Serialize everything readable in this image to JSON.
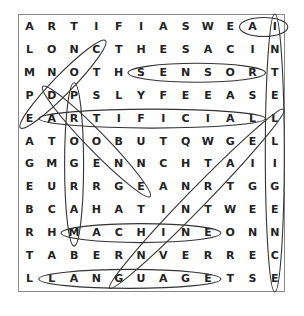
{
  "puzzle": {
    "grid": [
      [
        "A",
        "R",
        "T",
        "I",
        "F",
        "I",
        "A",
        "S",
        "W",
        "E",
        "A",
        "I"
      ],
      [
        "L",
        "O",
        "N",
        "C",
        "T",
        "H",
        "E",
        "S",
        "A",
        "C",
        "I",
        "N"
      ],
      [
        "M",
        "N",
        "O",
        "T",
        "H",
        "S",
        "E",
        "N",
        "S",
        "O",
        "R",
        "T"
      ],
      [
        "P",
        "D",
        "P",
        "S",
        "L",
        "Y",
        "F",
        "E",
        "E",
        "A",
        "S",
        "E"
      ],
      [
        "E",
        "A",
        "R",
        "T",
        "I",
        "F",
        "I",
        "C",
        "I",
        "A",
        "L",
        "L"
      ],
      [
        "A",
        "T",
        "O",
        "O",
        "B",
        "U",
        "T",
        "Q",
        "W",
        "G",
        "E",
        "L"
      ],
      [
        "G",
        "M",
        "G",
        "E",
        "N",
        "N",
        "C",
        "H",
        "T",
        "A",
        "I",
        "I"
      ],
      [
        "E",
        "U",
        "R",
        "R",
        "G",
        "E",
        "A",
        "N",
        "R",
        "T",
        "G",
        "G"
      ],
      [
        "B",
        "C",
        "A",
        "H",
        "A",
        "T",
        "I",
        "N",
        "T",
        "W",
        "E",
        "E"
      ],
      [
        "R",
        "H",
        "M",
        "A",
        "C",
        "H",
        "I",
        "N",
        "E",
        "O",
        "N",
        "N"
      ],
      [
        "T",
        "A",
        "B",
        "E",
        "R",
        "N",
        "V",
        "E",
        "R",
        "R",
        "E",
        "C"
      ],
      [
        "L",
        "L",
        "A",
        "N",
        "G",
        "U",
        "A",
        "G",
        "E",
        "T",
        "S",
        "E"
      ]
    ],
    "found_words": [
      {
        "word": "AI",
        "start": [
          1,
          11
        ],
        "end": [
          1,
          12
        ]
      },
      {
        "word": "INTELLIGENCE",
        "start": [
          1,
          12
        ],
        "end": [
          12,
          12
        ]
      },
      {
        "word": "SENSOR",
        "start": [
          3,
          6
        ],
        "end": [
          3,
          11
        ]
      },
      {
        "word": "ARTIFICIAL",
        "start": [
          5,
          2
        ],
        "end": [
          5,
          11
        ]
      },
      {
        "word": "MACHINE",
        "start": [
          10,
          3
        ],
        "end": [
          10,
          9
        ]
      },
      {
        "word": "LANGUAGE",
        "start": [
          12,
          2
        ],
        "end": [
          12,
          9
        ]
      },
      {
        "word": "CODE",
        "start": [
          2,
          4
        ],
        "end": [
          5,
          1
        ]
      },
      {
        "word": "PROGRAM",
        "start": [
          4,
          3
        ],
        "end": [
          10,
          3
        ]
      },
      {
        "word": "DRONE",
        "start": [
          4,
          2
        ],
        "end": [
          8,
          6
        ]
      },
      {
        "word": "LEARNING",
        "start": [
          5,
          12
        ],
        "end": [
          12,
          5
        ]
      }
    ]
  }
}
